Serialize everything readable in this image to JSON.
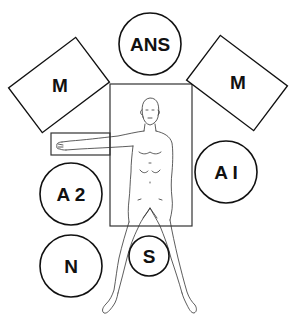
{
  "diagram": {
    "type": "electrode-placement",
    "colors": {
      "stroke": "#111111",
      "figure_stroke": "#333333",
      "background": "#ffffff"
    },
    "figure": {
      "description": "human figure, supine, right arm extended to the side on arm board"
    },
    "zones": [
      {
        "id": "ans",
        "label": "ANS",
        "shape": "circle",
        "cx": 150,
        "cy": 44,
        "r": 31
      },
      {
        "id": "m-left",
        "label": "M",
        "shape": "rotated-rect",
        "cx": 59,
        "cy": 85,
        "w": 84,
        "h": 56,
        "angle": -37
      },
      {
        "id": "m-right",
        "label": "M",
        "shape": "rotated-rect",
        "cx": 237,
        "cy": 83,
        "w": 84,
        "h": 56,
        "angle": 37
      },
      {
        "id": "a1",
        "label": "A I",
        "shape": "circle",
        "cx": 226,
        "cy": 172,
        "r": 31
      },
      {
        "id": "a2",
        "label": "A 2",
        "shape": "circle",
        "cx": 71,
        "cy": 194,
        "r": 31
      },
      {
        "id": "n",
        "label": "N",
        "shape": "circle",
        "cx": 71,
        "cy": 266,
        "r": 31
      },
      {
        "id": "s",
        "label": "S",
        "shape": "circle",
        "cx": 149,
        "cy": 256,
        "r": 20
      }
    ],
    "body_board": {
      "x": 110,
      "y": 84,
      "w": 82,
      "h": 142
    },
    "arm_board": {
      "x": 51,
      "y": 133,
      "w": 59,
      "h": 22
    }
  }
}
